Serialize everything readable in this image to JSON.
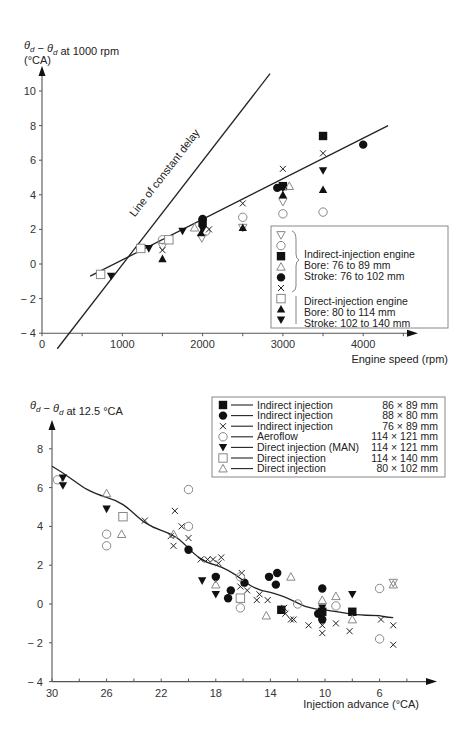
{
  "chart_data": [
    {
      "type": "scatter",
      "title": "",
      "ylabel": "θd − θd at 1000 rpm",
      "ylabel_unit": "(°CA)",
      "xlabel": "Engine speed (rpm)",
      "xlim": [
        0,
        4500
      ],
      "ylim": [
        -4,
        11
      ],
      "xticks": [
        0,
        1000,
        2000,
        3000,
        4000
      ],
      "xtick_labels": [
        "0",
        "1000",
        "2000",
        "3000",
        "4000"
      ],
      "yticks": [
        -4,
        -2,
        0,
        2,
        4,
        6,
        8,
        10
      ],
      "ytick_labels": [
        "− 4",
        "− 2",
        "0",
        "2",
        "4",
        "6",
        "8",
        "10"
      ],
      "grid": false,
      "legend_position": "bottom-right",
      "annotations": [
        {
          "text": "Line of constant delay",
          "along": "constant_delay_line"
        }
      ],
      "lines": [
        {
          "name": "constant_delay_line",
          "x": [
            190,
            2840
          ],
          "y": [
            -4.9,
            11.0
          ]
        },
        {
          "name": "fit_line",
          "x": [
            600,
            4310
          ],
          "y": [
            -0.7,
            8.0
          ]
        }
      ],
      "legend": {
        "markers": [
          "tri-down-open",
          "circle-open",
          "square-filled",
          "tri-up-open",
          "circle-filled",
          "cross",
          "square-open",
          "tri-up-filled",
          "tri-down-filled"
        ],
        "groups": [
          {
            "title": "Indirect-injection engine",
            "lines": [
              "Bore: 76 to 89 mm",
              "Stroke: 76 to 102 mm"
            ]
          },
          {
            "title": "Direct-injection engine",
            "lines": [
              "Bore: 80 to 114 mm",
              "Stroke: 102 to 140 mm"
            ]
          }
        ]
      },
      "series": [
        {
          "name": "Indirect ▽",
          "marker": "tri-down-open",
          "points": [
            [
              1500,
              1.0
            ],
            [
              1990,
              1.5
            ],
            [
              2500,
              2.1
            ],
            [
              3000,
              3.6
            ]
          ]
        },
        {
          "name": "Indirect ○",
          "marker": "circle-open",
          "points": [
            [
              1500,
              1.4
            ],
            [
              2040,
              1.9
            ],
            [
              2500,
              2.7
            ],
            [
              3000,
              2.9
            ],
            [
              3500,
              3.0
            ]
          ]
        },
        {
          "name": "Indirect ■",
          "marker": "square-filled",
          "points": [
            [
              2000,
              2.4
            ],
            [
              3000,
              4.5
            ],
            [
              3500,
              7.4
            ]
          ]
        },
        {
          "name": "Indirect △",
          "marker": "tri-up-open",
          "points": [
            [
              1900,
              2.1
            ],
            [
              3080,
              4.5
            ]
          ]
        },
        {
          "name": "Indirect ●",
          "marker": "circle-filled",
          "points": [
            [
              2000,
              2.6
            ],
            [
              2930,
              4.4
            ],
            [
              4000,
              6.9
            ]
          ]
        },
        {
          "name": "Indirect ×",
          "marker": "cross",
          "points": [
            [
              1500,
              0.8
            ],
            [
              2080,
              2.0
            ],
            [
              2500,
              3.5
            ],
            [
              3000,
              5.5
            ],
            [
              3500,
              6.4
            ]
          ]
        },
        {
          "name": "Direct □",
          "marker": "square-open",
          "points": [
            [
              730,
              -0.6
            ],
            [
              1230,
              0.9
            ],
            [
              1580,
              1.4
            ]
          ]
        },
        {
          "name": "Direct ▲",
          "marker": "tri-up-filled",
          "points": [
            [
              1500,
              0.3
            ],
            [
              1980,
              1.8
            ],
            [
              2500,
              2.1
            ],
            [
              3000,
              4.0
            ],
            [
              3500,
              4.3
            ]
          ]
        },
        {
          "name": "Direct ▼",
          "marker": "tri-down-filled",
          "points": [
            [
              860,
              -0.7
            ],
            [
              1330,
              0.9
            ],
            [
              1750,
              1.9
            ],
            [
              2000,
              2.0
            ],
            [
              3000,
              4.4
            ],
            [
              3500,
              5.4
            ]
          ]
        }
      ]
    },
    {
      "type": "scatter",
      "title": "",
      "ylabel": "θd − θd at 12.5 °CA",
      "xlabel": "Injection advance (°CA)",
      "xlim": [
        30,
        4
      ],
      "ylim": [
        -4,
        9
      ],
      "xticks": [
        30,
        26,
        22,
        18,
        14,
        10,
        6
      ],
      "xtick_labels": [
        "30",
        "26",
        "22",
        "18",
        "14",
        "10",
        "6"
      ],
      "yticks": [
        -4,
        -2,
        0,
        2,
        4,
        6,
        8
      ],
      "ytick_labels": [
        "− 4",
        "− 2",
        "0",
        "2",
        "4",
        "6",
        "8"
      ],
      "grid": false,
      "legend_position": "top-right",
      "curve": {
        "x": [
          30,
          26,
          22,
          18,
          14,
          10,
          6,
          5
        ],
        "y": [
          7.1,
          5.5,
          3.8,
          2.0,
          0.6,
          -0.3,
          -0.6,
          -0.7
        ]
      },
      "legend": {
        "entries": [
          {
            "marker": "square-filled",
            "label": "Indirect injection",
            "size": "86 × 89 mm"
          },
          {
            "marker": "circle-filled",
            "label": "Indirect injection",
            "size": "88 × 80 mm"
          },
          {
            "marker": "cross",
            "label": "Indirect injection",
            "size": "76 × 89 mm"
          },
          {
            "marker": "circle-open",
            "label": "Aeroflow",
            "size": "114 × 121 mm"
          },
          {
            "marker": "tri-down-filled",
            "label": "Direct injection (MAN)",
            "size": "114 × 121 mm"
          },
          {
            "marker": "square-open",
            "label": "Direct injection",
            "size": "114 × 140 mm"
          },
          {
            "marker": "tri-up-open",
            "label": "Direct injection",
            "size": "80 × 102 mm"
          }
        ]
      },
      "series": [
        {
          "name": "Indirect injection 86 × 89 mm",
          "marker": "square-filled",
          "points": [
            [
              13.2,
              -0.3
            ],
            [
              10.2,
              -0.4
            ],
            [
              8.0,
              -0.4
            ]
          ]
        },
        {
          "name": "Indirect injection 88 × 80 mm",
          "marker": "circle-filled",
          "points": [
            [
              20.0,
              2.8
            ],
            [
              18.0,
              1.4
            ],
            [
              17.1,
              0.3
            ],
            [
              15.9,
              1.1
            ],
            [
              16.9,
              0.7
            ],
            [
              14.1,
              1.4
            ],
            [
              13.5,
              1.6
            ],
            [
              13.6,
              1.0
            ],
            [
              10.2,
              0.8
            ],
            [
              10.2,
              -0.8
            ],
            [
              10.5,
              -0.5
            ]
          ]
        },
        {
          "name": "Indirect injection 76 × 89 mm",
          "marker": "cross",
          "points": [
            [
              23.2,
              4.3
            ],
            [
              21.0,
              4.8
            ],
            [
              20.5,
              4.0
            ],
            [
              21.3,
              3.5
            ],
            [
              21.1,
              3.0
            ],
            [
              20.0,
              3.4
            ],
            [
              19.1,
              2.3
            ],
            [
              18.6,
              2.3
            ],
            [
              18.2,
              2.3
            ],
            [
              17.8,
              2.1
            ],
            [
              17.6,
              2.4
            ],
            [
              16.1,
              1.6
            ],
            [
              16.2,
              0.9
            ],
            [
              15.7,
              0.7
            ],
            [
              15.0,
              0.2
            ],
            [
              14.8,
              0.5
            ],
            [
              14.2,
              0.2
            ],
            [
              13.0,
              -0.2
            ],
            [
              12.9,
              -0.5
            ],
            [
              12.5,
              -0.8
            ],
            [
              12.3,
              -0.8
            ],
            [
              11.2,
              -1.1
            ],
            [
              10.2,
              -1.1
            ],
            [
              10.2,
              -1.5
            ],
            [
              9.2,
              -1.0
            ],
            [
              8.2,
              -1.4
            ],
            [
              5.9,
              -0.8
            ],
            [
              5.0,
              -1.1
            ],
            [
              5.0,
              -2.1
            ]
          ]
        },
        {
          "name": "Aeroflow 114 × 121 mm",
          "marker": "circle-open",
          "points": [
            [
              29.6,
              6.4
            ],
            [
              26.0,
              3.6
            ],
            [
              26.0,
              3.0
            ],
            [
              20.0,
              5.9
            ],
            [
              20.0,
              4.0
            ],
            [
              16.2,
              1.4
            ],
            [
              16.2,
              -0.2
            ],
            [
              12.0,
              0.0
            ],
            [
              9.2,
              -0.1
            ],
            [
              6.0,
              0.8
            ],
            [
              6.0,
              -1.8
            ]
          ]
        },
        {
          "name": "Direct injection (MAN) 114 × 121 mm",
          "marker": "tri-down-filled",
          "points": [
            [
              29.2,
              6.5
            ],
            [
              29.2,
              6.1
            ],
            [
              26.0,
              4.9
            ],
            [
              19.0,
              1.2
            ],
            [
              18.0,
              1.3
            ],
            [
              18.0,
              0.5
            ],
            [
              10.2,
              -0.2
            ],
            [
              8.0,
              0.5
            ]
          ]
        },
        {
          "name": "Direct injection 114 × 140 mm",
          "marker": "square-open",
          "points": [
            [
              24.8,
              4.5
            ],
            [
              16.2,
              0.3
            ]
          ]
        },
        {
          "name": "Direct injection 80 × 102 mm",
          "marker": "tri-up-open",
          "points": [
            [
              26.0,
              5.7
            ],
            [
              24.9,
              3.6
            ],
            [
              21.1,
              3.6
            ],
            [
              12.5,
              1.4
            ],
            [
              14.3,
              -0.6
            ],
            [
              10.2,
              0.2
            ],
            [
              9.2,
              0.4
            ],
            [
              8.0,
              -0.8
            ],
            [
              18.0,
              1.0
            ],
            [
              5.0,
              1.0
            ]
          ]
        }
      ]
    }
  ]
}
